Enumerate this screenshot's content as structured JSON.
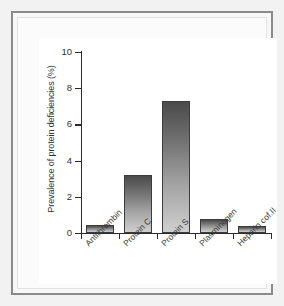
{
  "chart_data": {
    "type": "bar",
    "title": "",
    "xlabel": "",
    "ylabel": "Prevalence of protein deficiencies (%)",
    "categories": [
      "Antithrombin",
      "Protein C",
      "Protein S",
      "Plasminogen",
      "Heparin cof.II"
    ],
    "values": [
      0.45,
      3.2,
      7.3,
      0.8,
      0.4
    ],
    "ylim": [
      0,
      10
    ],
    "yticks": [
      0,
      2,
      4,
      6,
      8,
      10
    ],
    "ytick_labels": [
      "0",
      "2",
      "4",
      "6",
      "8",
      "10"
    ],
    "grid": false,
    "legend": false,
    "bar_color_top": "#4a4a4a",
    "bar_color_bottom": "#cfcfcf",
    "axis_color": "#2b2b2b",
    "background": "#ffffff"
  },
  "frame": {
    "border_color": "#8a8a8a",
    "page_background": "#f2f2f2"
  }
}
